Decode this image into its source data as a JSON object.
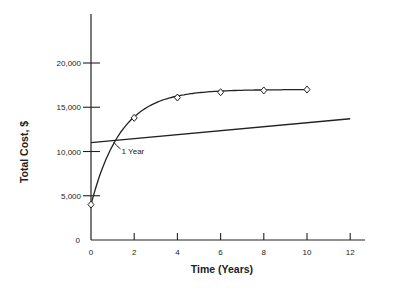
{
  "chart_data": {
    "type": "line",
    "title": "",
    "xlabel": "Time (Years)",
    "ylabel": "Total Cost, $",
    "xlim": [
      0,
      12
    ],
    "ylim": [
      0,
      25000
    ],
    "x_ticks": [
      "0",
      "2",
      "4",
      "6",
      "8",
      "10",
      "12"
    ],
    "y_ticks": [
      "0",
      "5,000",
      "10,000",
      "15,000",
      "20,000"
    ],
    "grid": false,
    "legend": null,
    "series": [
      {
        "name": "Curve (diamond markers)",
        "x": [
          0,
          2,
          4,
          6,
          8,
          10
        ],
        "y": [
          4000,
          13800,
          16100,
          16700,
          16900,
          17000
        ],
        "marker": "diamond"
      },
      {
        "name": "Straight line",
        "x": [
          0,
          12
        ],
        "y": [
          11000,
          13700
        ],
        "marker": "none"
      }
    ],
    "annotations": [
      {
        "text": "1 Year",
        "x": 1,
        "y": 11300
      }
    ]
  }
}
